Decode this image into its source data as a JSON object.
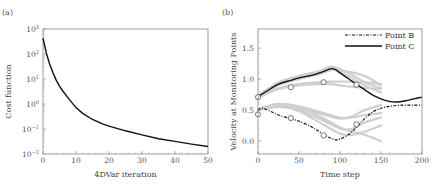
{
  "chart_data": [
    {
      "type": "line",
      "panel_label": "(a)",
      "title": "",
      "xlabel": "4DVar iteration",
      "ylabel": "Cost function",
      "xlim": [
        0,
        50
      ],
      "ylim": [
        0.01,
        1000
      ],
      "yscale": "log",
      "grid": false,
      "x_ticks": [
        0,
        10,
        20,
        30,
        40,
        50
      ],
      "y_ticks": [
        {
          "value": 1000,
          "label_base": "10",
          "label_exp": "3"
        },
        {
          "value": 100,
          "label_base": "10",
          "label_exp": "2"
        },
        {
          "value": 10,
          "label_base": "10",
          "label_exp": "1"
        },
        {
          "value": 1,
          "label_base": "10",
          "label_exp": "0"
        },
        {
          "value": 0.1,
          "label_base": "10",
          "label_exp": "−1"
        },
        {
          "value": 0.01,
          "label_base": "10",
          "label_exp": "−2"
        }
      ],
      "series": [
        {
          "name": "Cost function",
          "color": "#111111",
          "x": [
            0,
            1,
            2,
            3,
            4,
            5,
            6,
            8,
            10,
            12,
            15,
            18,
            20,
            25,
            30,
            35,
            40,
            45,
            50
          ],
          "y": [
            430,
            110,
            40,
            18,
            9,
            5.2,
            3.3,
            1.5,
            0.72,
            0.42,
            0.24,
            0.16,
            0.13,
            0.085,
            0.058,
            0.041,
            0.032,
            0.025,
            0.02
          ]
        }
      ]
    },
    {
      "type": "line",
      "panel_label": "(b)",
      "title": "",
      "xlabel": "Time step",
      "ylabel": "Velocity at Monitoring Points",
      "xlim": [
        0,
        200
      ],
      "ylim": [
        -0.21,
        1.81
      ],
      "grid": false,
      "legend_position": "upper right",
      "x_ticks": [
        0,
        50,
        100,
        150,
        200
      ],
      "y_ticks": [
        0.0,
        0.5,
        1.0,
        1.5
      ],
      "y_tick_labels": [
        "0.0",
        "0.5",
        "1.0",
        "1.5"
      ],
      "series": [
        {
          "name": "Point B",
          "style": "dash-dot",
          "color": "#111111",
          "x": [
            0,
            5,
            15,
            25,
            40,
            50,
            65,
            75,
            85,
            90,
            95,
            100,
            110,
            120,
            130,
            140,
            150,
            160,
            170,
            180,
            190,
            200
          ],
          "y": [
            0.5,
            0.53,
            0.48,
            0.42,
            0.36,
            0.32,
            0.23,
            0.15,
            0.07,
            0.04,
            0.02,
            0.03,
            0.1,
            0.22,
            0.36,
            0.47,
            0.53,
            0.56,
            0.575,
            0.58,
            0.58,
            0.58
          ]
        },
        {
          "name": "Point C",
          "style": "solid",
          "color": "#111111",
          "x": [
            0,
            10,
            25,
            40,
            50,
            65,
            75,
            85,
            90,
            95,
            100,
            110,
            120,
            130,
            140,
            150,
            160,
            170,
            180,
            190,
            200
          ],
          "y": [
            0.72,
            0.8,
            0.92,
            0.98,
            1.02,
            1.06,
            1.1,
            1.15,
            1.17,
            1.15,
            1.1,
            1.01,
            0.92,
            0.83,
            0.74,
            0.68,
            0.64,
            0.63,
            0.65,
            0.68,
            0.71
          ]
        }
      ],
      "ensemble_gray_curves": [
        {
          "x": [
            0,
            25,
            50,
            75,
            90,
            110,
            130,
            150
          ],
          "y": [
            0.73,
            0.95,
            1.05,
            1.13,
            1.2,
            1.1,
            0.95,
            0.85
          ]
        },
        {
          "x": [
            0,
            25,
            50,
            75,
            90,
            110,
            130,
            150
          ],
          "y": [
            0.72,
            0.93,
            1.03,
            1.1,
            1.17,
            1.05,
            0.9,
            0.78
          ]
        },
        {
          "x": [
            0,
            25,
            50,
            75,
            90,
            110,
            130,
            150
          ],
          "y": [
            0.71,
            0.9,
            1.0,
            1.08,
            1.15,
            1.12,
            1.05,
            0.9
          ]
        },
        {
          "x": [
            0,
            25,
            50,
            75,
            90,
            110,
            130,
            150
          ],
          "y": [
            0.7,
            0.85,
            0.92,
            0.95,
            0.96,
            0.96,
            0.95,
            0.92
          ]
        },
        {
          "x": [
            0,
            25,
            50,
            75,
            90,
            110,
            130,
            150
          ],
          "y": [
            0.7,
            0.84,
            0.9,
            0.92,
            0.92,
            0.88,
            0.86,
            0.84
          ]
        },
        {
          "x": [
            0,
            25,
            50,
            75,
            100,
            115,
            130,
            150
          ],
          "y": [
            0.5,
            0.55,
            0.52,
            0.45,
            0.36,
            0.4,
            0.5,
            0.58
          ]
        },
        {
          "x": [
            0,
            25,
            50,
            75,
            100,
            115,
            130,
            150
          ],
          "y": [
            0.52,
            0.6,
            0.56,
            0.47,
            0.38,
            0.38,
            0.42,
            0.45
          ]
        },
        {
          "x": [
            0,
            25,
            50,
            75,
            100,
            115,
            130,
            150
          ],
          "y": [
            0.5,
            0.57,
            0.5,
            0.36,
            0.2,
            0.2,
            0.3,
            0.38
          ]
        },
        {
          "x": [
            0,
            25,
            50,
            75,
            100,
            115,
            130,
            150
          ],
          "y": [
            0.5,
            0.58,
            0.54,
            0.4,
            0.22,
            0.15,
            0.1,
            0.0
          ]
        },
        {
          "x": [
            0,
            25,
            50,
            75,
            100,
            115,
            130,
            150
          ],
          "y": [
            0.5,
            0.56,
            0.48,
            0.3,
            0.12,
            0.1,
            0.15,
            0.25
          ]
        }
      ],
      "observations": [
        {
          "series": "Point C",
          "x": 0,
          "y": 0.71
        },
        {
          "series": "Point C",
          "x": 40,
          "y": 0.87
        },
        {
          "series": "Point C",
          "x": 80,
          "y": 0.95
        },
        {
          "series": "Point C",
          "x": 120,
          "y": 0.91
        },
        {
          "series": "Point B",
          "x": 0,
          "y": 0.43
        },
        {
          "series": "Point B",
          "x": 40,
          "y": 0.37
        },
        {
          "series": "Point B",
          "x": 80,
          "y": 0.09
        },
        {
          "series": "Point B",
          "x": 120,
          "y": 0.27
        }
      ]
    }
  ]
}
